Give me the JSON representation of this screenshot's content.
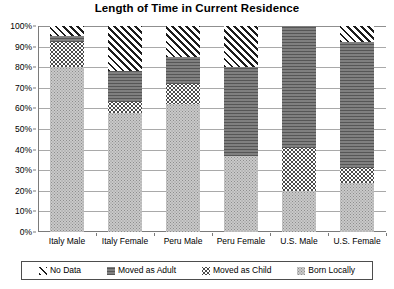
{
  "chart_data": {
    "type": "bar",
    "title": "Length of Time in Current Residence",
    "xlabel": "",
    "ylabel": "",
    "ylim": [
      0,
      100
    ],
    "grid": true,
    "stacked": true,
    "stack_order_bottom_to_top": [
      "Born Locally",
      "Moved as Child",
      "Moved as Adult",
      "No Data"
    ],
    "legend_position": "bottom",
    "categories": [
      "Italy Male",
      "Italy Female",
      "Peru Male",
      "Peru Female",
      "U.S. Male",
      "U.S. Female"
    ],
    "series": [
      {
        "name": "Born Locally",
        "values": [
          80,
          58,
          62,
          37,
          20,
          24
        ]
      },
      {
        "name": "Moved as Child",
        "values": [
          12,
          5,
          10,
          0,
          21,
          7
        ]
      },
      {
        "name": "Moved as Adult",
        "values": [
          3,
          15,
          13,
          43,
          59,
          61
        ]
      },
      {
        "name": "No Data",
        "values": [
          5,
          22,
          15,
          20,
          0,
          8
        ]
      }
    ],
    "ytick_labels": [
      "100%",
      "90%",
      "80%",
      "70%",
      "60%",
      "50%",
      "40%",
      "30%",
      "20%",
      "10%",
      "0%"
    ],
    "ytick_values": [
      100,
      90,
      80,
      70,
      60,
      50,
      40,
      30,
      20,
      10,
      0
    ]
  },
  "legend": {
    "items": [
      {
        "label": "No Data",
        "pattern": "diagonal-hatch"
      },
      {
        "label": "Moved as Adult",
        "pattern": "solid-dark"
      },
      {
        "label": "Moved as Child",
        "pattern": "coarse-dots"
      },
      {
        "label": "Born Locally",
        "pattern": "fine-dots"
      }
    ]
  },
  "colors": {
    "born_locally": "#c9c9c9",
    "moved_as_child": "#ffffff",
    "moved_as_adult": "#6e6e6e",
    "no_data": "#1c1c1c",
    "gridline": "#a9a9a9",
    "axis": "#7a7a7a"
  }
}
